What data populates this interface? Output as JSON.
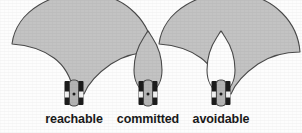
{
  "figure": {
    "background_color": "#fdfdfd",
    "fan_fill": "#c3c3c3",
    "fan_stroke": "#4a4a4a",
    "teardrop_fill": "#c3c3c3",
    "teardrop_cutout_fill": "#ffffff",
    "robot_body_fill": "#b4b4b4",
    "robot_wheel_fill": "#1c1c1c",
    "robot_center_dot": "#1c1c1c",
    "panels": [
      {
        "id": "reachable",
        "label": "reachable",
        "label_x": 74,
        "region_shape": "fan",
        "description": "wide fan-shaped reachable region above robot"
      },
      {
        "id": "committed",
        "label": "committed",
        "label_x": 148,
        "region_shape": "teardrop",
        "description": "narrow teardrop committed region above robot"
      },
      {
        "id": "avoidable",
        "label": "avoidable",
        "label_x": 221,
        "region_shape": "fan-minus-teardrop",
        "description": "fan region with teardrop cut out, avoidable region"
      }
    ]
  }
}
